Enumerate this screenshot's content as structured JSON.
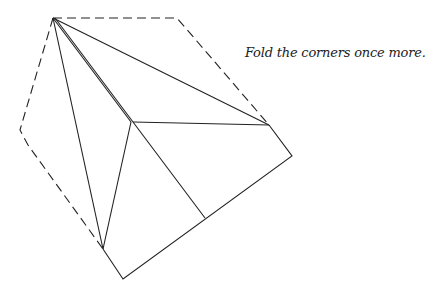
{
  "caption": "Fold the corners once more.",
  "colors": {
    "stroke": "#222222",
    "background": "#ffffff"
  },
  "diagram": {
    "dashed_outline": [
      [
        53,
        18
      ],
      [
        177,
        18
      ],
      [
        269,
        125
      ]
    ],
    "dashed_outline_left": [
      [
        53,
        18
      ],
      [
        20,
        130
      ],
      [
        28,
        145
      ],
      [
        103,
        249
      ]
    ],
    "solid_outline": [
      [
        269,
        125
      ],
      [
        292,
        156
      ],
      [
        123,
        279
      ],
      [
        103,
        249
      ]
    ],
    "crease_lines": [
      [
        [
          53,
          18
        ],
        [
          103,
          249
        ]
      ],
      [
        [
          53,
          18
        ],
        [
          131,
          122
        ]
      ],
      [
        [
          55,
          18
        ],
        [
          205,
          218
        ]
      ],
      [
        [
          53,
          18
        ],
        [
          269,
          125
        ]
      ],
      [
        [
          133,
          122
        ],
        [
          269,
          125
        ]
      ],
      [
        [
          131,
          122
        ],
        [
          103,
          249
        ]
      ]
    ]
  }
}
